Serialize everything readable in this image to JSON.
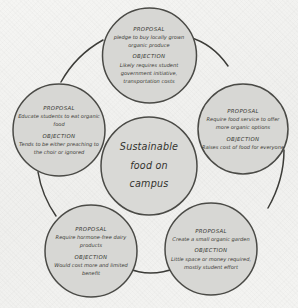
{
  "diagram": {
    "title": "Sustainable food on campus",
    "center": {
      "label": "Sustainable food on campus",
      "lines": [
        "Sustainable",
        "food on",
        "campus"
      ]
    },
    "labels": {
      "proposal": "PROPOSAL",
      "objection": "OBJECTION"
    },
    "colors": {
      "background": "#f3f3f1",
      "node_fill": "#d7d7d4",
      "node_stroke": "#4a4a46",
      "text": "#34342f",
      "connector": "#3c3c38"
    },
    "nodes": [
      {
        "id": "buy-local-produce",
        "position": "top",
        "proposal_label": "PROPOSAL",
        "proposal_text": "pledge to buy locally grown organic produce",
        "objection_label": "OBJECTION",
        "objection_text": "Likely requires student government initiative, transportation costs"
      },
      {
        "id": "food-service-organic-options",
        "position": "right",
        "proposal_label": "PROPOSAL",
        "proposal_text": "Require food service to offer more organic options",
        "objection_label": "OBJECTION",
        "objection_text": "Raises cost of food for everyone"
      },
      {
        "id": "small-organic-garden",
        "position": "bottom-right",
        "proposal_label": "PROPOSAL",
        "proposal_text": "Create a small organic garden",
        "objection_label": "OBJECTION",
        "objection_text": "Little space or money required, mostly student effort"
      },
      {
        "id": "hormone-free-dairy",
        "position": "bottom-left",
        "proposal_label": "PROPOSAL",
        "proposal_text": "Require hormone-free dairy products",
        "objection_label": "OBJECTION",
        "objection_text": "Would cost more and limited benefit"
      },
      {
        "id": "educate-students",
        "position": "left",
        "proposal_label": "PROPOSAL",
        "proposal_text": "Educate students to eat organic food",
        "objection_label": "OBJECTION",
        "objection_text": "Tends to be either preaching to the choir or ignored"
      }
    ]
  }
}
